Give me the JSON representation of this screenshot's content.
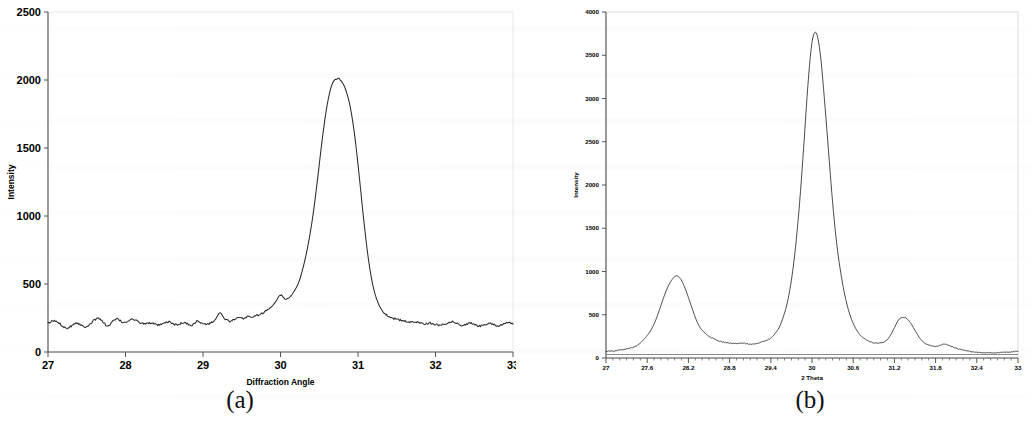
{
  "figure": {
    "panels": [
      {
        "id": "a",
        "caption": "(a)",
        "name": "xrd-pattern-panel-a"
      },
      {
        "id": "b",
        "caption": "(b)",
        "name": "xrd-pattern-panel-b"
      }
    ]
  },
  "chart_data": [
    {
      "type": "line",
      "panel": "(a)",
      "title": "",
      "xlabel": "Diffraction Angle",
      "ylabel": "Intensity",
      "xlim": [
        27,
        33
      ],
      "ylim": [
        0,
        2500
      ],
      "xticks": [
        27,
        28,
        29,
        30,
        31,
        32,
        33
      ],
      "xtick_labels": [
        "27",
        "28",
        "29",
        "30",
        "31",
        "32",
        "33"
      ],
      "yticks": [
        0,
        500,
        1000,
        1500,
        2000,
        2500
      ],
      "ytick_labels": [
        "0",
        "500",
        "1000",
        "1500",
        "2000",
        "2500"
      ],
      "grid": false,
      "legend": null,
      "peaks": [
        {
          "x": 29.35,
          "y": 2010
        }
      ],
      "baseline": 205,
      "x": [
        27.0,
        27.06,
        27.12,
        27.18,
        27.24,
        27.3,
        27.36,
        27.42,
        27.48,
        27.54,
        27.6,
        27.66,
        27.72,
        27.78,
        27.84,
        27.9,
        27.96,
        28.02,
        28.08,
        28.14,
        28.2,
        28.26,
        28.32,
        28.38,
        28.44,
        28.5,
        28.56,
        28.62,
        28.68,
        28.74,
        28.8,
        28.86,
        28.92,
        28.98,
        29.04,
        29.1,
        29.16,
        29.22,
        29.28,
        29.34,
        29.4,
        29.46,
        29.52,
        29.58,
        29.64,
        29.7,
        29.76,
        29.82,
        29.88,
        29.94,
        30.0,
        30.06,
        30.12,
        30.18,
        30.24,
        30.3,
        30.36,
        30.42,
        30.48,
        30.54,
        30.6,
        30.66,
        30.72,
        30.78,
        30.84,
        30.9,
        30.96,
        31.02,
        31.08,
        31.14,
        31.2,
        31.26,
        31.32,
        31.38,
        31.44,
        31.5,
        31.56,
        31.62,
        31.68,
        31.74,
        31.8,
        31.86,
        31.92,
        31.98,
        32.04,
        32.1,
        32.16,
        32.22,
        32.28,
        32.34,
        32.4,
        32.46,
        32.52,
        32.58,
        32.64,
        32.7,
        32.76,
        32.82,
        32.88,
        32.94,
        33.0
      ],
      "y": [
        210,
        228,
        222,
        196,
        176,
        192,
        215,
        200,
        186,
        205,
        235,
        248,
        214,
        190,
        228,
        242,
        219,
        225,
        241,
        229,
        214,
        207,
        215,
        203,
        198,
        210,
        222,
        206,
        199,
        217,
        206,
        198,
        226,
        212,
        204,
        213,
        240,
        288,
        243,
        228,
        236,
        250,
        246,
        262,
        258,
        270,
        282,
        305,
        330,
        372,
        420,
        392,
        404,
        450,
        520,
        640,
        800,
        1010,
        1280,
        1570,
        1810,
        1960,
        2010,
        1995,
        1930,
        1800,
        1580,
        1270,
        940,
        660,
        470,
        360,
        300,
        268,
        252,
        240,
        232,
        225,
        218,
        222,
        215,
        208,
        212,
        205,
        198,
        204,
        215,
        222,
        209,
        196,
        205,
        212,
        198,
        190,
        204,
        212,
        200,
        192,
        206,
        214,
        205
      ],
      "y_full": [
        210,
        228,
        222,
        196,
        176,
        192,
        215,
        200,
        186,
        205,
        235,
        248,
        214,
        190,
        228,
        242,
        219,
        225,
        241,
        229,
        214,
        207,
        215,
        203,
        198,
        210,
        222,
        206,
        199,
        217,
        206,
        198,
        226,
        212,
        204,
        213,
        240,
        288,
        243,
        228,
        236,
        250,
        246,
        262,
        258,
        270,
        282,
        305,
        330,
        372,
        420,
        392,
        404,
        450,
        520,
        640,
        800,
        1010,
        1280,
        1570,
        1810,
        1960,
        2010,
        1995,
        1930,
        1800,
        1580,
        1270,
        940,
        660,
        470,
        360,
        300,
        268,
        252,
        240,
        232,
        225,
        218,
        222,
        215,
        208,
        212,
        205,
        198,
        204,
        215,
        222,
        209,
        196,
        205,
        212,
        198,
        190,
        204,
        212,
        200,
        192,
        206,
        214,
        205
      ]
    },
    {
      "type": "line",
      "panel": "(b)",
      "title": "",
      "xlabel": "2 Theta",
      "ylabel": "Intensity",
      "xlim": [
        27,
        33
      ],
      "ylim": [
        0,
        4000
      ],
      "xticks": [
        27,
        27.6,
        28.2,
        28.8,
        29.4,
        30,
        30.6,
        31.2,
        31.8,
        32.4,
        33
      ],
      "xtick_labels": [
        "27",
        "27.6",
        "28.2",
        "28.8",
        "29.4",
        "30",
        "30.6",
        "31.2",
        "31.8",
        "32.4",
        "33"
      ],
      "yticks": [
        0,
        500,
        1000,
        1500,
        2000,
        2500,
        3000,
        3500,
        4000
      ],
      "ytick_labels": [
        "0",
        "500",
        "1000",
        "1500",
        "2000",
        "2500",
        "3000",
        "3500",
        "4000"
      ],
      "grid": false,
      "legend": null,
      "peaks": [
        {
          "x": 28.05,
          "y": 950
        },
        {
          "x": 29.95,
          "y": 3760
        },
        {
          "x": 31.2,
          "y": 470
        }
      ],
      "baseline": 60,
      "x": [
        27.0,
        27.06,
        27.12,
        27.18,
        27.24,
        27.3,
        27.36,
        27.42,
        27.48,
        27.54,
        27.6,
        27.66,
        27.72,
        27.78,
        27.84,
        27.9,
        27.96,
        28.02,
        28.08,
        28.14,
        28.2,
        28.26,
        28.32,
        28.38,
        28.44,
        28.5,
        28.56,
        28.62,
        28.68,
        28.74,
        28.8,
        28.86,
        28.92,
        28.98,
        29.04,
        29.1,
        29.16,
        29.22,
        29.28,
        29.34,
        29.4,
        29.46,
        29.52,
        29.58,
        29.64,
        29.7,
        29.76,
        29.82,
        29.88,
        29.94,
        30.0,
        30.06,
        30.12,
        30.18,
        30.24,
        30.3,
        30.36,
        30.42,
        30.48,
        30.54,
        30.6,
        30.66,
        30.72,
        30.78,
        30.84,
        30.9,
        30.96,
        31.02,
        31.08,
        31.14,
        31.2,
        31.26,
        31.32,
        31.38,
        31.44,
        31.5,
        31.56,
        31.62,
        31.68,
        31.74,
        31.8,
        31.86,
        31.92,
        31.98,
        32.04,
        32.1,
        32.16,
        32.22,
        32.28,
        32.34,
        32.4,
        32.46,
        32.52,
        32.58,
        32.64,
        32.7,
        32.76,
        32.82,
        32.88,
        32.94,
        33.0
      ],
      "y": [
        75,
        82,
        78,
        90,
        96,
        104,
        118,
        132,
        160,
        205,
        260,
        330,
        430,
        560,
        700,
        820,
        905,
        950,
        920,
        830,
        700,
        560,
        430,
        340,
        290,
        250,
        225,
        205,
        190,
        180,
        172,
        165,
        168,
        172,
        165,
        158,
        162,
        175,
        190,
        205,
        230,
        280,
        350,
        470,
        640,
        900,
        1280,
        1800,
        2450,
        3150,
        3650,
        3760,
        3520,
        3000,
        2400,
        1800,
        1320,
        980,
        720,
        530,
        400,
        310,
        250,
        215,
        190,
        175,
        170,
        178,
        200,
        260,
        350,
        440,
        470,
        455,
        400,
        320,
        240,
        185,
        155,
        140,
        135,
        145,
        160,
        150,
        130,
        112,
        98,
        88,
        80,
        72,
        66,
        62,
        60,
        58,
        60,
        62,
        64,
        66,
        70,
        74,
        78
      ]
    }
  ]
}
